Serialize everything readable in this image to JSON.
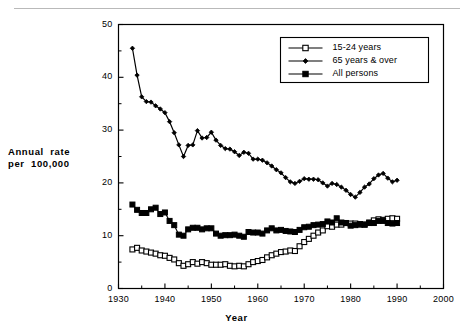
{
  "figure": {
    "background": "#ffffff",
    "ink": "#000000"
  },
  "axes": {
    "ylabel_line1": "Annual  rate",
    "ylabel_line2": "per  100,000",
    "xlabel": "Year",
    "ytick_labels": [
      "0",
      "10",
      "20",
      "30",
      "40",
      "50"
    ],
    "xtick_labels": [
      "1930",
      "1940",
      "1950",
      "1960",
      "1970",
      "1980",
      "1990",
      "2000"
    ]
  },
  "legend": {
    "position": "top-right-inside",
    "entries": [
      {
        "label": "15-24 years",
        "marker": "open-square"
      },
      {
        "label": "65 years & over",
        "marker": "filled-diamond"
      },
      {
        "label": "All persons",
        "marker": "filled-square"
      }
    ]
  },
  "chart_data": {
    "type": "line",
    "title": "",
    "subtitle": "",
    "xlabel": "Year",
    "ylabel": "Annual rate per 100,000",
    "xlim": [
      1930,
      2000
    ],
    "ylim": [
      0,
      50
    ],
    "xticks": [
      1930,
      1940,
      1950,
      1960,
      1970,
      1980,
      1990,
      2000
    ],
    "yticks": [
      0,
      10,
      20,
      30,
      40,
      50
    ],
    "minor_xtick_step": 5,
    "minor_ytick_step": 5,
    "grid": false,
    "legend_position": "upper right",
    "x": [
      1933,
      1934,
      1935,
      1936,
      1937,
      1938,
      1939,
      1940,
      1941,
      1942,
      1943,
      1944,
      1945,
      1946,
      1947,
      1948,
      1949,
      1950,
      1951,
      1952,
      1953,
      1954,
      1955,
      1956,
      1957,
      1958,
      1959,
      1960,
      1961,
      1962,
      1963,
      1964,
      1965,
      1966,
      1967,
      1968,
      1969,
      1970,
      1971,
      1972,
      1973,
      1974,
      1975,
      1976,
      1977,
      1978,
      1979,
      1980,
      1981,
      1982,
      1983,
      1984,
      1985,
      1986,
      1987,
      1988,
      1989,
      1990
    ],
    "series": [
      {
        "name": "15-24 years",
        "marker": "open-square",
        "values": [
          7.4,
          7.7,
          7.2,
          7.0,
          6.8,
          6.6,
          6.3,
          6.2,
          5.8,
          5.5,
          4.8,
          4.3,
          4.6,
          5.0,
          4.7,
          5.0,
          4.8,
          4.5,
          4.5,
          4.5,
          4.6,
          4.3,
          4.2,
          4.3,
          4.2,
          4.6,
          5.0,
          5.2,
          5.4,
          5.9,
          6.3,
          6.6,
          6.9,
          7.0,
          7.2,
          7.1,
          8.0,
          8.8,
          9.4,
          10.0,
          10.6,
          11.0,
          11.8,
          11.7,
          12.1,
          12.1,
          12.4,
          12.3,
          12.3,
          12.1,
          12.1,
          12.5,
          12.9,
          13.1,
          13.0,
          13.2,
          13.3,
          13.2
        ]
      },
      {
        "name": "65 years & over",
        "marker": "filled-diamond",
        "values": [
          45.5,
          40.4,
          36.3,
          35.4,
          35.3,
          34.6,
          34.0,
          33.3,
          31.6,
          29.5,
          27.2,
          25.0,
          27.1,
          27.2,
          29.9,
          28.5,
          28.6,
          29.6,
          28.1,
          27.1,
          26.5,
          26.4,
          25.9,
          25.2,
          25.8,
          25.6,
          24.5,
          24.5,
          24.3,
          23.8,
          23.2,
          22.5,
          21.9,
          21.0,
          20.2,
          19.9,
          20.3,
          20.8,
          20.7,
          20.7,
          20.6,
          20.0,
          19.4,
          19.9,
          19.7,
          19.2,
          18.6,
          17.8,
          17.3,
          18.2,
          19.2,
          19.8,
          20.8,
          21.5,
          21.8,
          20.9,
          20.2,
          20.5
        ]
      },
      {
        "name": "All persons",
        "marker": "filled-square",
        "values": [
          15.9,
          14.9,
          14.3,
          14.3,
          15.0,
          15.3,
          14.1,
          14.4,
          12.8,
          12.0,
          10.2,
          10.0,
          11.2,
          11.5,
          11.5,
          11.2,
          11.4,
          11.4,
          10.4,
          10.0,
          10.1,
          10.1,
          10.2,
          10.0,
          9.8,
          10.7,
          10.6,
          10.6,
          10.4,
          11.0,
          11.4,
          11.0,
          11.1,
          10.9,
          10.8,
          10.7,
          11.1,
          11.6,
          11.7,
          12.0,
          12.1,
          12.2,
          12.7,
          12.5,
          13.3,
          12.5,
          12.4,
          11.9,
          12.0,
          12.2,
          12.1,
          12.4,
          12.4,
          12.8,
          12.8,
          12.4,
          12.3,
          12.4
        ]
      }
    ]
  }
}
